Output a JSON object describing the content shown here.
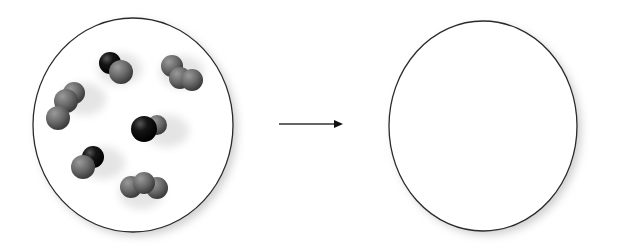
{
  "diagram": {
    "type": "reaction-before-after",
    "colors": {
      "background": "#ffffff",
      "circle_outline": "#2a2a2a",
      "carbon_atom": "#111111",
      "oxygen_atom": "#6e6e6e",
      "arrow": "#333333"
    },
    "before_panel": {
      "label": "reactants",
      "molecules": [
        {
          "kind": "CO",
          "atoms": [
            {
              "el": "C",
              "x": 110,
              "y": 63,
              "r": 11
            },
            {
              "el": "O",
              "x": 121,
              "y": 72,
              "r": 12
            }
          ]
        },
        {
          "kind": "O2",
          "atoms": [
            {
              "el": "O",
              "x": 172,
              "y": 66,
              "r": 11
            },
            {
              "el": "O",
              "x": 180,
              "y": 78,
              "r": 11
            },
            {
              "el": "O",
              "x": 192,
              "y": 80,
              "r": 11
            }
          ]
        },
        {
          "kind": "O2",
          "atoms": [
            {
              "el": "O",
              "x": 74,
              "y": 93,
              "r": 11
            },
            {
              "el": "O",
              "x": 66,
              "y": 101,
              "r": 12
            },
            {
              "el": "O",
              "x": 58,
              "y": 118,
              "r": 12
            }
          ]
        },
        {
          "kind": "CO",
          "atoms": [
            {
              "el": "O",
              "x": 157,
              "y": 125,
              "r": 10
            },
            {
              "el": "C",
              "x": 144,
              "y": 129,
              "r": 13
            }
          ]
        },
        {
          "kind": "CO",
          "atoms": [
            {
              "el": "C",
              "x": 93,
              "y": 157,
              "r": 11
            },
            {
              "el": "O",
              "x": 83,
              "y": 167,
              "r": 12
            }
          ]
        },
        {
          "kind": "O2",
          "atoms": [
            {
              "el": "O",
              "x": 131,
              "y": 187,
              "r": 11
            },
            {
              "el": "O",
              "x": 157,
              "y": 188,
              "r": 11
            },
            {
              "el": "O",
              "x": 144,
              "y": 183,
              "r": 11
            }
          ]
        }
      ]
    },
    "arrow": {
      "x1": 279,
      "y1": 124,
      "x2": 342,
      "y2": 124
    },
    "after_panel": {
      "label": "products",
      "molecules": []
    }
  }
}
